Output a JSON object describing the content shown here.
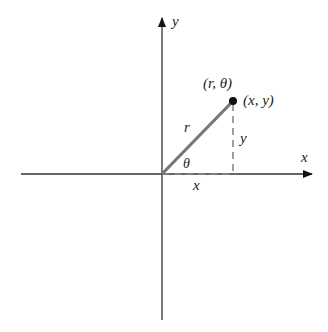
{
  "diagram": {
    "labels": {
      "y_axis": "y",
      "x_axis": "x",
      "polar_point": "(r, θ)",
      "rect_point": "(x, y)",
      "radius": "r",
      "angle": "θ",
      "vertical_leg": "y",
      "horizontal_leg": "x"
    },
    "colors": {
      "axis": "#222222",
      "radius_line": "#707070",
      "dashed": "#808080",
      "point": "#111111"
    }
  }
}
